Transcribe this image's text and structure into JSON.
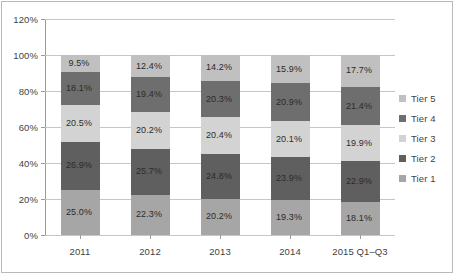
{
  "chart_data": {
    "type": "bar",
    "subtype": "100% stacked column",
    "title": "",
    "subtitle": "",
    "xlabel": "",
    "ylabel": "",
    "categories": [
      "2011",
      "2012",
      "2013",
      "2014",
      "2015 Q1–Q3"
    ],
    "series": [
      {
        "name": "Tier 1",
        "color": "#a6a6a6",
        "values": [
          25.0,
          22.3,
          20.2,
          19.3,
          18.1
        ],
        "labels": [
          "25.0%",
          "22.3%",
          "20.2%",
          "19.3%",
          "18.1%"
        ]
      },
      {
        "name": "Tier 2",
        "color": "#5f5f5f",
        "values": [
          26.9,
          25.7,
          24.8,
          23.9,
          22.9
        ],
        "labels": [
          "26.9%",
          "25.7%",
          "24.8%",
          "23.9%",
          "22.9%"
        ]
      },
      {
        "name": "Tier 3",
        "color": "#d3d3d3",
        "values": [
          20.5,
          20.2,
          20.4,
          20.1,
          19.9
        ],
        "labels": [
          "20.5%",
          "20.2%",
          "20.4%",
          "20.1%",
          "19.9%"
        ]
      },
      {
        "name": "Tier 4",
        "color": "#6e6e6e",
        "values": [
          18.1,
          19.4,
          20.3,
          20.9,
          21.4
        ],
        "labels": [
          "18.1%",
          "19.4%",
          "20.3%",
          "20.9%",
          "21.4%"
        ]
      },
      {
        "name": "Tier 5",
        "color": "#c0c0c0",
        "values": [
          9.5,
          12.4,
          14.2,
          15.9,
          17.7
        ],
        "labels": [
          "9.5%",
          "12.4%",
          "14.2%",
          "15.9%",
          "17.7%"
        ]
      }
    ],
    "ylim": [
      0,
      120
    ],
    "ytick_labels": [
      "0%",
      "20%",
      "40%",
      "60%",
      "80%",
      "100%",
      "120%"
    ],
    "ytick_values": [
      0,
      20,
      40,
      60,
      80,
      100,
      120
    ],
    "grid": "horizontal",
    "legend_position": "right",
    "legend_order": [
      "Tier 5",
      "Tier 4",
      "Tier 3",
      "Tier 2",
      "Tier 1"
    ]
  },
  "colors": {
    "background": "#ffffff",
    "gridline": "#c6c6c6",
    "axis": "#9a9a9a",
    "frame": "#b9b9b9",
    "text": "#3f3f3f",
    "label_text": "#2b2b2b"
  }
}
